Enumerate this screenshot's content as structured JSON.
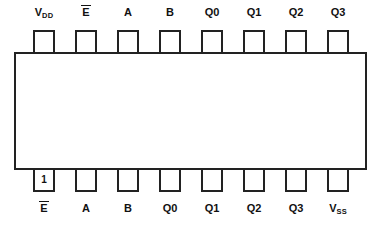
{
  "pins": {
    "top": [
      {
        "base": "V",
        "sub": "DD"
      },
      {
        "base": "E",
        "overline": true
      },
      {
        "base": "A"
      },
      {
        "base": "B"
      },
      {
        "base": "Q0"
      },
      {
        "base": "Q1"
      },
      {
        "base": "Q2"
      },
      {
        "base": "Q3"
      }
    ],
    "bottom": [
      {
        "base": "E",
        "overline": true,
        "pin_number": "1"
      },
      {
        "base": "A"
      },
      {
        "base": "B"
      },
      {
        "base": "Q0"
      },
      {
        "base": "Q1"
      },
      {
        "base": "Q2"
      },
      {
        "base": "Q3"
      },
      {
        "base": "V",
        "sub": "SS"
      }
    ]
  },
  "colors": {
    "line": "#222222",
    "text": "#111111",
    "background": "#ffffff"
  }
}
